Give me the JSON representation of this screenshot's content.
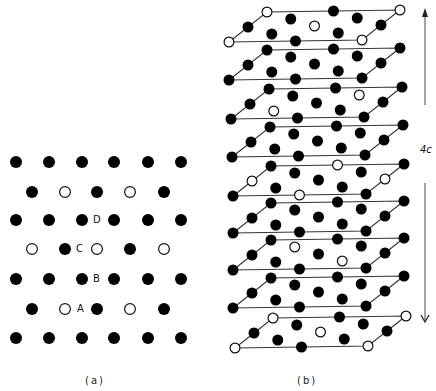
{
  "figure": {
    "panel_a": {
      "caption": "(a)",
      "dot_radius": 6,
      "rows": [
        {
          "y": 162,
          "atoms": [
            [
              16,
              "f"
            ],
            [
              49,
              "f"
            ],
            [
              82,
              "f"
            ],
            [
              114,
              "f"
            ],
            [
              148,
              "f"
            ],
            [
              181,
              "f"
            ]
          ]
        },
        {
          "y": 192,
          "atoms": [
            [
              32,
              "f"
            ],
            [
              65,
              "o"
            ],
            [
              97,
              "f"
            ],
            [
              130,
              "o"
            ],
            [
              164,
              "f"
            ]
          ]
        },
        {
          "y": 220,
          "atoms": [
            [
              16,
              "f"
            ],
            [
              49,
              "f"
            ],
            [
              82,
              "f"
            ],
            [
              114,
              "f"
            ],
            [
              148,
              "f"
            ],
            [
              181,
              "f"
            ]
          ]
        },
        {
          "y": 249,
          "atoms": [
            [
              32,
              "o"
            ],
            [
              65,
              "f"
            ],
            [
              97,
              "o"
            ],
            [
              130,
              "f"
            ],
            [
              164,
              "o"
            ]
          ]
        },
        {
          "y": 279,
          "atoms": [
            [
              16,
              "f"
            ],
            [
              49,
              "f"
            ],
            [
              82,
              "f"
            ],
            [
              114,
              "f"
            ],
            [
              148,
              "f"
            ],
            [
              181,
              "f"
            ]
          ]
        },
        {
          "y": 309,
          "atoms": [
            [
              32,
              "f"
            ],
            [
              65,
              "o"
            ],
            [
              97,
              "f"
            ],
            [
              130,
              "o"
            ],
            [
              164,
              "f"
            ]
          ]
        },
        {
          "y": 338,
          "atoms": [
            [
              16,
              "f"
            ],
            [
              49,
              "f"
            ],
            [
              82,
              "f"
            ],
            [
              114,
              "f"
            ],
            [
              148,
              "f"
            ],
            [
              181,
              "f"
            ]
          ]
        }
      ],
      "site_labels": [
        {
          "text": "D",
          "x": 89,
          "y": 215
        },
        {
          "text": "C",
          "x": 72,
          "y": 244
        },
        {
          "text": "B",
          "x": 89,
          "y": 274
        },
        {
          "text": "A",
          "x": 73,
          "y": 304
        }
      ]
    },
    "panel_b": {
      "caption": "(b)",
      "dot_radius": 5.5,
      "vec_a": [
        133,
        -2
      ],
      "vec_b": [
        -38,
        30
      ],
      "sites": [
        [
          0,
          0
        ],
        [
          0.5,
          0
        ],
        [
          1,
          0
        ],
        [
          0,
          0.5
        ],
        [
          1,
          0.5
        ],
        [
          0,
          1
        ],
        [
          0.5,
          1
        ],
        [
          1,
          1
        ],
        [
          0.25,
          0.25
        ],
        [
          0.75,
          0.25
        ],
        [
          0.5,
          0.5
        ],
        [
          0.25,
          0.75
        ],
        [
          0.75,
          0.75
        ]
      ],
      "layers": [
        {
          "origin": [
            267,
            12
          ],
          "open": [
            [
              0,
              0
            ],
            [
              1,
              0
            ],
            [
              0,
              1
            ],
            [
              1,
              1
            ],
            [
              0.5,
              0.5
            ]
          ]
        },
        {
          "origin": [
            267,
            50
          ],
          "open": []
        },
        {
          "origin": [
            269,
            89
          ],
          "open": [
            [
              0.75,
              0.25
            ],
            [
              0.25,
              0.75
            ]
          ]
        },
        {
          "origin": [
            270,
            127
          ],
          "open": []
        },
        {
          "origin": [
            271,
            166
          ],
          "open": [
            [
              0.5,
              0
            ],
            [
              0,
              0.5
            ],
            [
              1,
              0.5
            ],
            [
              0.5,
              1
            ]
          ]
        },
        {
          "origin": [
            271,
            203
          ],
          "open": []
        },
        {
          "origin": [
            271,
            240
          ],
          "open": [
            [
              0.25,
              0.25
            ],
            [
              0.75,
              0.75
            ]
          ]
        },
        {
          "origin": [
            271,
            278
          ],
          "open": []
        },
        {
          "origin": [
            273,
            318
          ],
          "open": [
            [
              0,
              0
            ],
            [
              1,
              0
            ],
            [
              0,
              1
            ],
            [
              1,
              1
            ],
            [
              0.5,
              0.5
            ]
          ]
        }
      ],
      "dimension": {
        "label": "4c",
        "x": 425,
        "top": 8,
        "upper_end": 105,
        "lower_start": 183,
        "bottom": 322,
        "label_x": 420,
        "label_y": 145
      }
    },
    "colors": {
      "atom_filled": "#000000",
      "atom_open_stroke": "#111111",
      "atom_open_fill": "#ffffff",
      "line": "#333333"
    }
  }
}
